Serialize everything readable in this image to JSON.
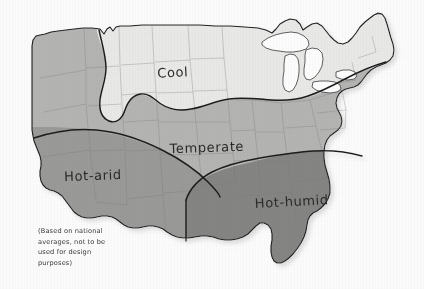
{
  "document": {
    "type": "hand-drawn climate zone map",
    "subject": "United States climate zones",
    "background_color": "#fcfcfc"
  },
  "map": {
    "name": "us-climate-zone-map",
    "outline_color": "#222222",
    "state_border_color": "#7d7d7d",
    "zone_divider_color": "#1e1e1e",
    "lake_fill": "#fdfdfd"
  },
  "zones": [
    {
      "id": "cool",
      "label": "Cool",
      "color": "#e9e9e7",
      "label_x": 173,
      "label_y": 77,
      "label_rotation": -3
    },
    {
      "id": "temperate",
      "label": "Temperate",
      "color": "#b4b4b2",
      "label_x": 207,
      "label_y": 152,
      "label_rotation": -2
    },
    {
      "id": "hot-arid",
      "label": "Hot-arid",
      "color": "#9a9a98",
      "label_x": 93,
      "label_y": 180,
      "label_rotation": -2
    },
    {
      "id": "hot-humid",
      "label": "Hot-humid",
      "color": "#858583",
      "label_x": 292,
      "label_y": 206,
      "label_rotation": -3
    }
  ],
  "caption": {
    "name": "disclaimer-note",
    "lines": [
      "(Based on national",
      "averages, not to be",
      "used for design",
      "purposes)"
    ],
    "x": 38,
    "y": 233,
    "line_height": 10.5
  },
  "lakes": [
    {
      "id": "lake-superior"
    },
    {
      "id": "lake-michigan"
    },
    {
      "id": "lake-huron"
    },
    {
      "id": "lake-erie"
    },
    {
      "id": "lake-ontario"
    }
  ]
}
